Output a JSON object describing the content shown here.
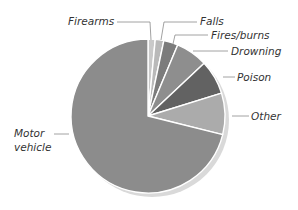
{
  "chart_data": {
    "type": "pie",
    "title": "",
    "start_angle_deg": 0,
    "direction": "clockwise",
    "slices": [
      {
        "label": "Firearms",
        "value": 1.5,
        "color": "#c9c9c9"
      },
      {
        "label": "Falls",
        "value": 1.8,
        "color": "#b9b9b9"
      },
      {
        "label": "Fires/burns",
        "value": 3.0,
        "color": "#7c7c7c"
      },
      {
        "label": "Drowning",
        "value": 6.7,
        "color": "#8e8e8e"
      },
      {
        "label": "Poison",
        "value": 7.2,
        "color": "#626262"
      },
      {
        "label": "Other",
        "value": 8.7,
        "color": "#ababab"
      },
      {
        "label": "Motor vehicle",
        "value": 71.1,
        "color": "#8c8c8c"
      }
    ],
    "shadow_color": "#d9d9d9",
    "legend": "none",
    "labels_style": "callout"
  }
}
